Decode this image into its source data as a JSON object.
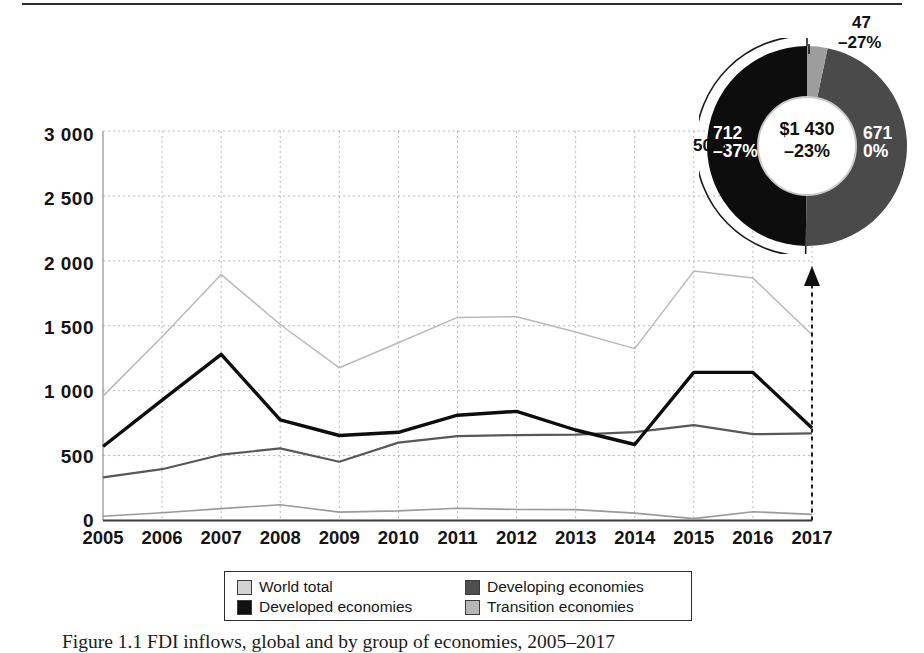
{
  "figure": {
    "caption": "Figure 1.1  FDI inflows, global and by group of economies, 2005–2017"
  },
  "chart_data": {
    "type": "line",
    "title": "",
    "xlabel": "",
    "ylabel": "",
    "ylim": [
      0,
      3000
    ],
    "yticks": [
      "0",
      "500",
      "1 000",
      "1 500",
      "2 000",
      "2 500",
      "3 000"
    ],
    "grid": true,
    "legend_position": "bottom",
    "categories": [
      "2005",
      "2006",
      "2007",
      "2008",
      "2009",
      "2010",
      "2011",
      "2012",
      "2013",
      "2014",
      "2015",
      "2016",
      "2017"
    ],
    "series": [
      {
        "name": "World total",
        "color": "#b9b9b9",
        "values": [
          958,
          1415,
          1894,
          1510,
          1176,
          1369,
          1564,
          1570,
          1452,
          1324,
          1921,
          1868,
          1430
        ]
      },
      {
        "name": "Developed economies",
        "color": "#0d0d0d",
        "values": [
          570,
          927,
          1279,
          775,
          655,
          679,
          811,
          840,
          697,
          585,
          1141,
          1141,
          712
        ]
      },
      {
        "name": "Developing economies",
        "color": "#585858",
        "values": [
          332,
          395,
          507,
          555,
          453,
          600,
          650,
          658,
          662,
          681,
          735,
          665,
          671
        ]
      },
      {
        "name": "Transition economies",
        "color": "#9a9a9a",
        "values": [
          32,
          60,
          92,
          122,
          65,
          74,
          95,
          85,
          84,
          57,
          15,
          68,
          47
        ]
      }
    ]
  },
  "donut_chart": {
    "type": "pie",
    "center_value": "$1 430",
    "center_change": "–23%",
    "outer_bracket_label": "50%",
    "slices": [
      {
        "name": "Transition economies",
        "value": "47",
        "change": "–27%",
        "share": 3.3,
        "color": "#9d9d9d"
      },
      {
        "name": "Developing economies",
        "value": "671",
        "change": "0%",
        "share": 46.9,
        "color": "#4a4a4a"
      },
      {
        "name": "Developed economies",
        "value": "712",
        "change": "–37%",
        "share": 49.8,
        "color": "#0d0d0d"
      }
    ]
  },
  "legend": {
    "items": [
      {
        "label": "World total",
        "color": "#d3d3d3"
      },
      {
        "label": "Developing economies",
        "color": "#4f4f4f"
      },
      {
        "label": "Developed economies",
        "color": "#111111"
      },
      {
        "label": "Transition economies",
        "color": "#b6b6b6"
      }
    ]
  }
}
